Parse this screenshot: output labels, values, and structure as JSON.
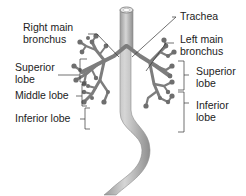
{
  "diagram": {
    "labels": {
      "right_main_bronchus": [
        "Right main",
        "bronchus"
      ],
      "trachea": "Trachea",
      "left_main_bronchus": [
        "Left main",
        "bronchus"
      ],
      "right_superior_lobe": [
        "Superior",
        "lobe"
      ],
      "right_middle_lobe": "Middle lobe",
      "right_inferior_lobe": "Inferior lobe",
      "left_superior_lobe": [
        "Superior",
        "lobe"
      ],
      "left_inferior_lobe": [
        "Inferior",
        "lobe"
      ]
    },
    "colors": {
      "airway": "#8a8a8a",
      "airway_dark": "#5f5f5f",
      "esophagus": "#b4b4b4",
      "leader_line": "#333333",
      "text": "#222222"
    }
  }
}
